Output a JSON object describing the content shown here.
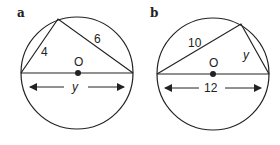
{
  "figures": [
    {
      "part_label": "a",
      "center_label": "O",
      "side_left": "4",
      "side_right": "6",
      "diameter_label": "y"
    },
    {
      "part_label": "b",
      "center_label": "O",
      "side_left": "10",
      "side_right": "y",
      "diameter_label": "12"
    }
  ],
  "colors": {
    "stroke": "#222222",
    "background": "#ffffff"
  }
}
